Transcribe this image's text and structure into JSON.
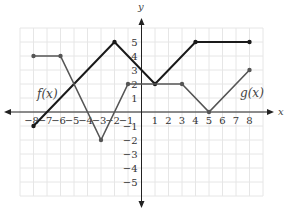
{
  "chart_data": {
    "type": "line",
    "title": "",
    "xlabel": "x",
    "ylabel": "y",
    "xlim": [
      -9,
      9
    ],
    "ylim": [
      -6,
      6
    ],
    "grid": true,
    "x_ticks": [
      -8,
      -7,
      -6,
      -5,
      -4,
      -3,
      -2,
      -1,
      1,
      2,
      3,
      4,
      5,
      6,
      7,
      8
    ],
    "y_ticks": [
      -5,
      -4,
      -3,
      -2,
      -1,
      1,
      2,
      3,
      4,
      5
    ],
    "series": [
      {
        "name": "f(x)",
        "color": "#1a1a1a",
        "points": [
          [
            -8,
            -1
          ],
          [
            -2,
            5
          ],
          [
            1,
            2
          ],
          [
            4,
            5
          ],
          [
            8,
            5
          ]
        ]
      },
      {
        "name": "g(x)",
        "color": "#555555",
        "points": [
          [
            -8,
            4
          ],
          [
            -6,
            4
          ],
          [
            -3,
            -2
          ],
          [
            -1,
            2
          ],
          [
            3,
            2
          ],
          [
            5,
            0
          ],
          [
            8,
            3
          ]
        ]
      }
    ],
    "annotations": [
      {
        "text": "f(x)",
        "x": -7.6,
        "y": 1.3
      },
      {
        "text": "g(x)",
        "x": 7.3,
        "y": 1.3
      }
    ]
  },
  "labels": {
    "x_axis": "x",
    "y_axis": "y",
    "f_label": "f(x)",
    "g_label": "g(x)"
  },
  "colors": {
    "grid": "#e6e6e6",
    "axis": "#222222",
    "f": "#1a1a1a",
    "g": "#555555"
  }
}
